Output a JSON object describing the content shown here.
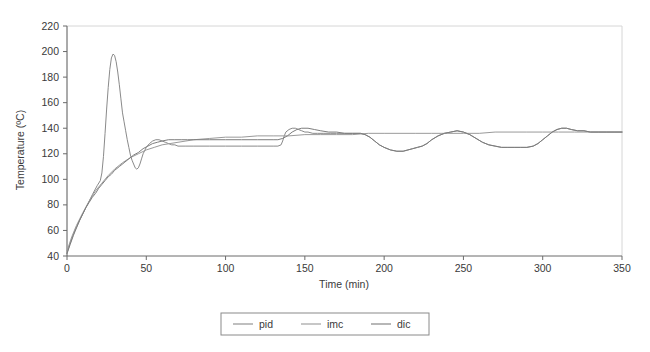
{
  "chart_data": {
    "type": "line",
    "title": "",
    "xlabel": "Time (min)",
    "ylabel": "Temperature (ºC)",
    "xlim": [
      0,
      350
    ],
    "ylim": [
      40,
      220
    ],
    "xticks": [
      0,
      50,
      100,
      150,
      200,
      250,
      300,
      350
    ],
    "yticks": [
      40,
      60,
      80,
      100,
      120,
      140,
      160,
      180,
      200,
      220
    ],
    "xtick_labels": [
      "0",
      "50",
      "100",
      "150",
      "200",
      "250",
      "300",
      "350"
    ],
    "ytick_labels": [
      "40",
      "60",
      "80",
      "100",
      "120",
      "140",
      "160",
      "180",
      "200",
      "220"
    ],
    "grid": false,
    "legend_position": "bottom-center",
    "legend_entries": [
      "pid",
      "imc",
      "dic"
    ],
    "series": [
      {
        "name": "pid",
        "color": "#8a8a8a",
        "x": [
          0,
          2,
          5,
          8,
          12,
          16,
          19,
          21,
          22,
          23,
          24,
          25,
          26,
          27,
          28,
          29,
          30,
          31,
          32,
          33,
          34,
          35,
          36,
          37,
          38,
          39,
          40,
          41,
          42,
          43,
          44,
          45,
          46,
          47,
          48,
          50,
          52,
          54,
          56,
          58,
          60,
          62,
          64,
          66,
          68,
          70,
          75,
          80,
          90,
          100,
          110,
          120,
          130,
          133,
          135,
          136,
          137,
          138,
          140,
          142,
          144,
          146,
          148,
          150,
          152,
          155,
          158,
          162,
          166,
          170,
          175,
          180,
          185,
          188,
          191,
          194,
          197,
          200,
          204,
          208,
          212,
          215,
          218,
          221,
          224,
          227,
          230,
          234,
          238,
          242,
          246,
          250,
          254,
          258,
          262,
          266,
          270,
          274,
          278,
          282,
          286,
          290,
          294,
          297,
          300,
          303,
          306,
          309,
          312,
          315,
          318,
          322,
          326,
          330,
          335,
          340,
          345,
          350
        ],
        "y": [
          42,
          50,
          60,
          68,
          78,
          88,
          95,
          99,
          105,
          118,
          136,
          155,
          172,
          186,
          195,
          198,
          197,
          192,
          184,
          174,
          163,
          152,
          145,
          138,
          131,
          125,
          119,
          115,
          112,
          109,
          108,
          109,
          112,
          116,
          120,
          125,
          128,
          130,
          131,
          131,
          130,
          129,
          128,
          127,
          127,
          126,
          126,
          126,
          126,
          126,
          126,
          126,
          126,
          126,
          127,
          130,
          134,
          137,
          139,
          140,
          140,
          139,
          138,
          137,
          137,
          136,
          136,
          136,
          136,
          136,
          136,
          136,
          136,
          135,
          133,
          130,
          127,
          125,
          123,
          122,
          122,
          123,
          124,
          125,
          126,
          128,
          131,
          134,
          136,
          137,
          138,
          137,
          135,
          132,
          129,
          127,
          126,
          125,
          125,
          125,
          125,
          125,
          126,
          128,
          131,
          134,
          137,
          139,
          140,
          140,
          139,
          138,
          138,
          137,
          137,
          137,
          137,
          137
        ]
      },
      {
        "name": "imc",
        "color": "#9a9a9a",
        "x": [
          0,
          3,
          6,
          10,
          14,
          18,
          22,
          26,
          30,
          35,
          40,
          45,
          50,
          55,
          60,
          65,
          70,
          75,
          80,
          90,
          100,
          110,
          120,
          130,
          140,
          150,
          160,
          170,
          180,
          190,
          200,
          210,
          220,
          230,
          240,
          250,
          260,
          270,
          280,
          290,
          300,
          310,
          320,
          330,
          340,
          350
        ],
        "y": [
          44,
          55,
          64,
          74,
          83,
          91,
          97,
          103,
          108,
          113,
          117,
          120,
          123,
          125,
          127,
          128,
          129,
          130,
          131,
          132,
          133,
          133,
          134,
          134,
          134,
          135,
          135,
          135,
          135,
          136,
          136,
          136,
          136,
          136,
          136,
          136,
          136,
          137,
          137,
          137,
          137,
          137,
          137,
          137,
          137,
          137
        ]
      },
      {
        "name": "dic",
        "color": "#7d7d7d",
        "x": [
          0,
          2,
          4,
          6,
          8,
          10,
          12,
          14,
          16,
          18,
          20,
          22,
          24,
          26,
          28,
          30,
          33,
          36,
          39,
          42,
          45,
          48,
          51,
          54,
          57,
          60,
          64,
          68,
          72,
          76,
          80,
          90,
          100,
          110,
          120,
          130,
          133,
          136,
          139,
          142,
          145,
          148,
          152,
          156,
          160,
          165,
          170,
          175,
          180,
          185,
          188,
          191,
          194,
          197,
          200,
          204,
          208,
          212,
          215,
          218,
          221,
          224,
          227,
          230,
          234,
          238,
          242,
          246,
          250,
          254,
          258,
          262,
          266,
          270,
          274,
          278,
          282,
          286,
          290,
          294,
          297,
          300,
          303,
          306,
          309,
          312,
          315,
          318,
          322,
          326,
          330,
          335,
          340,
          345,
          350
        ],
        "y": [
          42,
          49,
          56,
          62,
          68,
          73,
          78,
          82,
          86,
          89,
          93,
          96,
          99,
          102,
          104,
          107,
          110,
          113,
          116,
          119,
          121,
          124,
          126,
          128,
          129,
          130,
          131,
          131,
          131,
          131,
          131,
          131,
          131,
          131,
          131,
          131,
          131,
          132,
          134,
          137,
          139,
          140,
          140,
          139,
          138,
          137,
          137,
          136,
          136,
          136,
          135,
          133,
          130,
          127,
          125,
          123,
          122,
          122,
          123,
          124,
          125,
          126,
          128,
          131,
          134,
          136,
          137,
          138,
          137,
          135,
          132,
          129,
          127,
          126,
          125,
          125,
          125,
          125,
          125,
          126,
          128,
          131,
          134,
          137,
          139,
          140,
          140,
          139,
          138,
          138,
          137,
          137,
          137,
          137,
          137
        ]
      }
    ]
  }
}
